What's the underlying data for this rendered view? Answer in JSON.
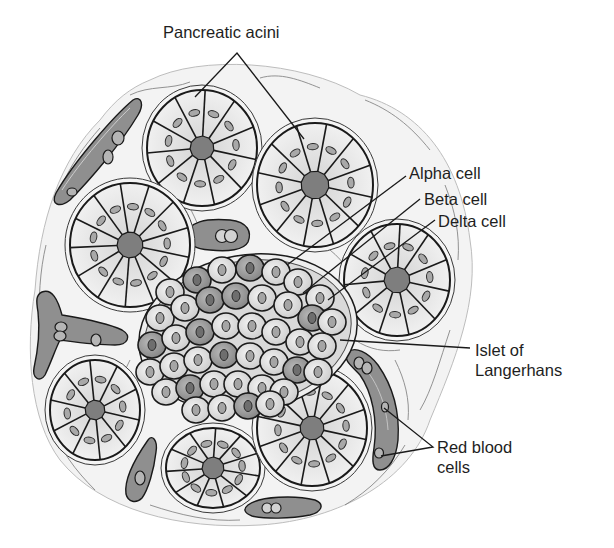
{
  "diagram": {
    "labels": {
      "acini": "Pancreatic acini",
      "alpha": "Alpha cell",
      "beta": "Beta cell",
      "delta": "Delta cell",
      "islet_line1": "Islet of",
      "islet_line2": "Langerhans",
      "rbc_line1": "Red blood",
      "rbc_line2": "cells"
    },
    "colors": {
      "background": "#ffffff",
      "stroma": "#f2f2f2",
      "acinar_cell": "#e6e6e6",
      "lumen": "#7e7e7e",
      "nucleus": "#a8a8a8",
      "vessel": "#8f8f8f",
      "islet_light": "#dcdcdc",
      "islet_dark": "#9a9a9a",
      "outline": "#1a1a1a"
    }
  }
}
